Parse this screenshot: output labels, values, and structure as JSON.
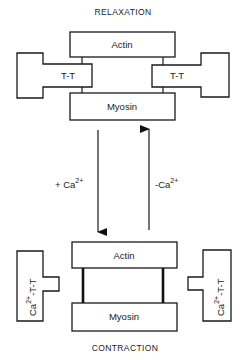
{
  "titles": {
    "top": "RELAXATION",
    "bottom": "CONTRACTION"
  },
  "relaxation": {
    "actin": "Actin",
    "myosin": "Myosin",
    "troponin_left": "T-T",
    "troponin_right": "T-T"
  },
  "contraction": {
    "actin": "Actin",
    "myosin": "Myosin",
    "complex_left": {
      "ion": "Ca",
      "charge": "2+",
      "rest": "-T-T"
    },
    "complex_right": {
      "ion": "Ca",
      "charge": "2+",
      "rest": "-T-T"
    }
  },
  "transitions": {
    "down": {
      "sign": "+ Ca",
      "charge": "2+"
    },
    "up": {
      "sign": "-Ca",
      "charge": "2+"
    }
  },
  "colors": {
    "line": "#1a1a1a",
    "background": "#ffffff"
  }
}
